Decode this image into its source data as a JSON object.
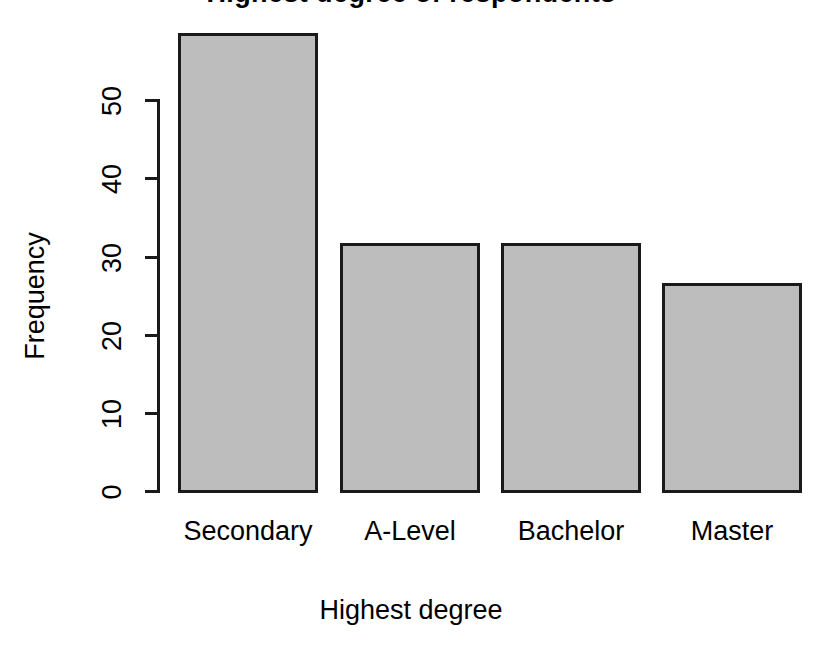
{
  "chart_data": {
    "type": "bar",
    "title": "",
    "title_fragment": "Highest degree of respondents",
    "xlabel": "Highest degree",
    "ylabel": "Frequency",
    "categories": [
      "Secondary",
      "A-Level",
      "Bachelor",
      "Master"
    ],
    "values": [
      58.5,
      31.8,
      31.8,
      26.7
    ],
    "ylim": [
      0,
      58.5
    ],
    "y_ticks": [
      0,
      10,
      20,
      30,
      40,
      50
    ],
    "y_tick_labels": [
      "0",
      "10",
      "20",
      "30",
      "40",
      "50"
    ],
    "grid": false,
    "legend": false,
    "legend_position": "none",
    "colors": {
      "bar_fill": "#bdbdbd",
      "bar_edge": "#1a1a1a",
      "axis": "#1a1a1a",
      "text": "#000000",
      "background": "#ffffff"
    }
  }
}
